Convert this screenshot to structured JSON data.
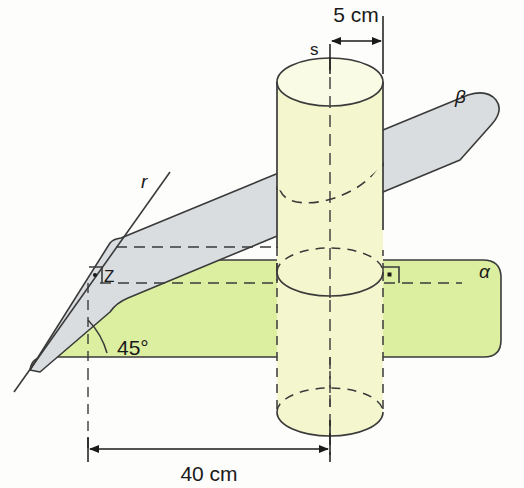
{
  "figure": {
    "colors": {
      "plane_alpha_fill": "#dcefa0",
      "plane_beta_fill": "#dadde0",
      "cylinder_fill": "#f4f7ce",
      "cylinder_top_fill": "#f7fade",
      "outline": "#3a3a3a",
      "background": "#fdfdfb"
    },
    "labels": {
      "top_dimension": "5 cm",
      "bottom_dimension": "40 cm",
      "apex_point": "s",
      "line_r": "r",
      "foot_point": "Z",
      "plane_beta": "β",
      "plane_alpha": "α",
      "angle": "45°"
    },
    "measurements": {
      "top_dimension_value": 5,
      "top_dimension_unit": "cm",
      "bottom_dimension_value": 40,
      "bottom_dimension_unit": "cm",
      "angle_value": 45,
      "angle_unit": "degrees"
    },
    "markers": {
      "right_angle_alpha": "right-angle",
      "right_angle_z": "right-angle"
    }
  }
}
